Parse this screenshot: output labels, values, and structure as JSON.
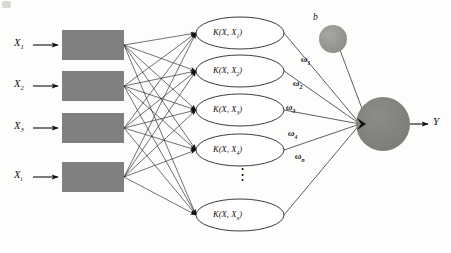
{
  "diagram": {
    "background_color": "#fdfdfc",
    "node_fill_gray": "#808080",
    "line_color": "#1a1a1a",
    "inputs": [
      {
        "label": "X",
        "sub": "1",
        "box_name": "input-box-1"
      },
      {
        "label": "X",
        "sub": "2",
        "box_name": "input-box-2"
      },
      {
        "label": "X",
        "sub": "3",
        "box_name": "input-box-3"
      },
      {
        "label": "X",
        "sub": "i",
        "box_name": "input-box-4"
      }
    ],
    "kernels": [
      {
        "prefix": "K(X, X",
        "sub": "1",
        "suffix": ")"
      },
      {
        "prefix": "K(X, X",
        "sub": "2",
        "suffix": ")"
      },
      {
        "prefix": "K(X, X",
        "sub": "3",
        "suffix": ")"
      },
      {
        "prefix": "K(X, X",
        "sub": "4",
        "suffix": ")"
      },
      {
        "prefix": "K(X, X",
        "sub": "n",
        "suffix": ")"
      }
    ],
    "ellipsis": "⋮",
    "weights": [
      {
        "label": "ω",
        "sub": "1"
      },
      {
        "label": "ω",
        "sub": "2"
      },
      {
        "label": "ω",
        "sub": "3"
      },
      {
        "label": "ω",
        "sub": "4"
      },
      {
        "label": "ω",
        "sub": "n"
      }
    ],
    "bias": {
      "label": "b"
    },
    "output": {
      "label": "Y"
    }
  }
}
